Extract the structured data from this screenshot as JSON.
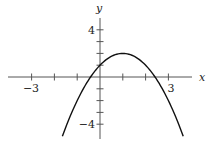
{
  "chart_data": {
    "type": "line",
    "title": "",
    "xlabel": "x",
    "ylabel": "y",
    "function": "y = -x^2 + 2x + 1",
    "vertex": [
      1,
      2
    ],
    "y_intercept": 1,
    "x_intercepts": [
      -0.414,
      2.414
    ],
    "x_domain_drawn": [
      -1.65,
      3.65
    ],
    "xlim": [
      -4,
      4
    ],
    "ylim": [
      -5.3,
      4.9
    ],
    "x_ticks": [
      -3,
      -2,
      -1,
      1,
      2,
      3
    ],
    "y_ticks": [
      -4,
      -3,
      -2,
      -1,
      1,
      2,
      3,
      4
    ],
    "x_tick_labels": [
      {
        "value": -3,
        "text": "−3"
      },
      {
        "value": 3,
        "text": "3"
      }
    ],
    "y_tick_labels": [
      {
        "value": 4,
        "text": "4"
      },
      {
        "value": -4,
        "text": "−4"
      }
    ],
    "grid": false,
    "legend": null,
    "colors": {
      "curve": "#111111",
      "axis": "#555555"
    }
  },
  "labels": {
    "x_axis": "x",
    "y_axis": "y",
    "x_neg3": "−3",
    "x_pos3": "3",
    "y_pos4": "4",
    "y_neg4": "−4"
  }
}
